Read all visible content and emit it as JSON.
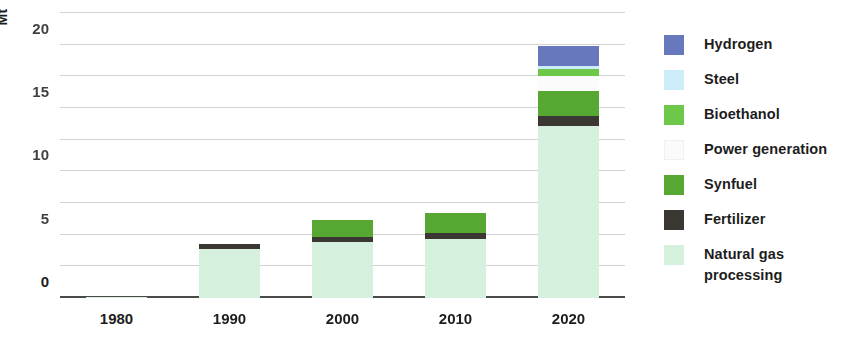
{
  "chart_data": {
    "type": "bar",
    "subtype": "stacked",
    "title": "",
    "xlabel": "",
    "ylabel": "Mt",
    "categories": [
      "1980",
      "1990",
      "2000",
      "2010",
      "2020"
    ],
    "ylim": [
      0,
      45
    ],
    "yticks": [
      0,
      5,
      10,
      15,
      20,
      25,
      30,
      35,
      40,
      45
    ],
    "ytick_labels": [
      "0",
      "5",
      "10",
      "15",
      "20",
      "25",
      "30",
      "35",
      "40",
      "45"
    ],
    "grid": true,
    "legend_position": "right",
    "series": [
      {
        "name": "Natural gas processing",
        "color": "#d6f0de",
        "values": [
          0.2,
          7.8,
          8.8,
          9.3,
          27.2
        ]
      },
      {
        "name": "Fertilizer",
        "color": "#3b3733",
        "values": [
          0,
          0.7,
          0.9,
          0.9,
          1.6
        ]
      },
      {
        "name": "Synfuel",
        "color": "#56a832",
        "values": [
          0,
          0,
          2.6,
          3.3,
          3.9
        ]
      },
      {
        "name": "Power generation",
        "color": "#fbfbfb",
        "values": [
          0,
          0,
          0,
          0,
          2.3
        ]
      },
      {
        "name": "Bioethanol",
        "color": "#6dc748",
        "values": [
          0,
          0,
          0,
          0,
          1.2
        ]
      },
      {
        "name": "Steel",
        "color": "#cdeef8",
        "values": [
          0,
          0,
          0,
          0,
          0.5
        ]
      },
      {
        "name": "Hydrogen",
        "color": "#6878bd",
        "values": [
          0,
          0,
          0,
          0,
          3.1
        ]
      }
    ],
    "totals": [
      0.2,
      8.5,
      12.3,
      13.5,
      39.8
    ]
  },
  "legend": {
    "items": [
      {
        "label": "Hydrogen",
        "color": "#6878bd"
      },
      {
        "label": "Steel",
        "color": "#cdeef8"
      },
      {
        "label": "Bioethanol",
        "color": "#6dc748"
      },
      {
        "label": "Power generation",
        "color": "#fbfbfb"
      },
      {
        "label": "Synfuel",
        "color": "#56a832"
      },
      {
        "label": "Fertilizer",
        "color": "#3b3733"
      },
      {
        "label": "Natural gas processing",
        "color": "#d6f0de"
      }
    ]
  },
  "axis": {
    "y_title": "Mt"
  },
  "colors": {
    "gridline": "#c9ccc9",
    "baseline": "#4a4a4a",
    "text": "#1d1d1d",
    "background": "#ffffff"
  }
}
